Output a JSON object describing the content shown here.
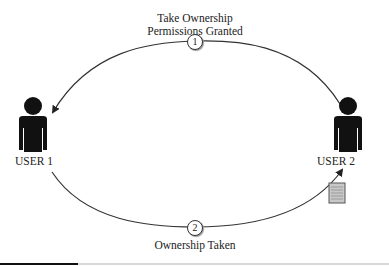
{
  "diagram": {
    "step1": {
      "number": "1",
      "label_line1": "Take Ownership",
      "label_line2": "Permissions Granted",
      "direction": "USER 2 -> USER 1"
    },
    "step2": {
      "number": "2",
      "label": "Ownership Taken",
      "direction": "USER 1 -> USER 2"
    },
    "users": [
      {
        "id": "user1",
        "label": "USER 1"
      },
      {
        "id": "user2",
        "label": "USER 2"
      }
    ],
    "icons": {
      "user1": "person-icon",
      "user2": "person-icon",
      "file": "document-icon"
    },
    "colors": {
      "line": "#333333",
      "figure": "#111111",
      "document_fill": "#c8c8c8",
      "document_border": "#555555"
    }
  }
}
